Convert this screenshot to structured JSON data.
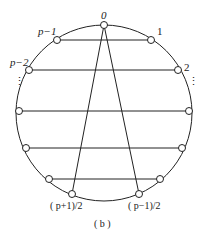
{
  "diagram": {
    "caption": "( b )",
    "labels": {
      "top": "0",
      "right1": "1",
      "right2": "2",
      "left1": "p−1",
      "left2": "p−2",
      "dots_left": "⋮",
      "dots_right": "⋮",
      "bottom_left": "( p+1)/2",
      "bottom_right": "( p−1)/2"
    }
  }
}
